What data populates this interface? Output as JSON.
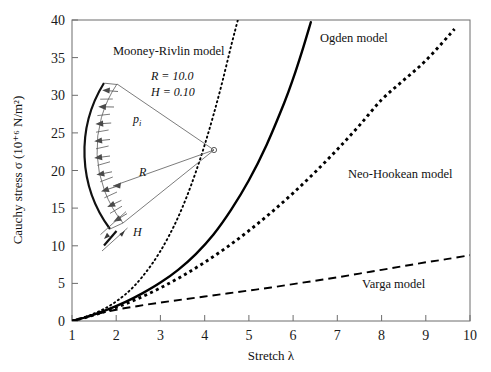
{
  "chart_data": {
    "type": "line",
    "title": "",
    "xlabel": "Stretch λ",
    "ylabel": "Cauchy stress σ (10⁺⁶ N/m²)",
    "xlim": [
      1,
      10
    ],
    "ylim": [
      0,
      40
    ],
    "xticks": [
      "1",
      "2",
      "3",
      "4",
      "5",
      "6",
      "7",
      "8",
      "9",
      "10"
    ],
    "yticks": [
      "0",
      "5",
      "10",
      "15",
      "20",
      "25",
      "30",
      "35",
      "40"
    ],
    "grid": false,
    "legend_position": "inline-annotations",
    "series": [
      {
        "name": "Mooney-Rivlin model",
        "style": "dotted",
        "color": "#000000",
        "x": [
          1.0,
          1.2,
          1.4,
          1.6,
          1.8,
          2.0,
          2.2,
          2.4,
          2.6,
          2.8,
          3.0,
          3.2,
          3.4,
          3.6,
          3.8,
          4.0,
          4.2,
          4.4,
          4.6,
          4.75
        ],
        "y": [
          0.0,
          0.35,
          0.75,
          1.25,
          1.85,
          2.6,
          3.5,
          4.6,
          5.95,
          7.5,
          9.3,
          11.4,
          13.8,
          16.6,
          19.8,
          23.4,
          27.4,
          31.8,
          36.6,
          40.0
        ]
      },
      {
        "name": "Ogden model",
        "style": "solid",
        "color": "#000000",
        "x": [
          1.0,
          1.4,
          1.8,
          2.2,
          2.6,
          3.0,
          3.4,
          3.8,
          4.2,
          4.6,
          5.0,
          5.4,
          5.8,
          6.0,
          6.2,
          6.4
        ],
        "y": [
          0.0,
          0.65,
          1.5,
          2.5,
          3.7,
          5.1,
          6.8,
          8.9,
          11.5,
          14.8,
          18.7,
          23.4,
          29.0,
          32.2,
          35.8,
          39.7
        ]
      },
      {
        "name": "Neo-Hookean model",
        "style": "dashed-dense",
        "color": "#000000",
        "x": [
          1.0,
          1.5,
          2.0,
          2.5,
          3.0,
          3.5,
          4.0,
          4.5,
          5.0,
          5.5,
          6.0,
          6.5,
          7.0,
          7.5,
          8.0,
          8.5,
          9.0,
          9.5,
          9.65
        ],
        "y": [
          0.0,
          0.8,
          1.8,
          3.0,
          4.4,
          6.0,
          7.8,
          9.8,
          12.0,
          14.4,
          17.0,
          19.8,
          22.8,
          26.0,
          29.4,
          32.0,
          34.6,
          37.8,
          38.8
        ]
      },
      {
        "name": "Varga model",
        "style": "dashed",
        "color": "#000000",
        "x": [
          1.0,
          1.5,
          2.0,
          2.5,
          3.0,
          3.5,
          4.0,
          4.5,
          5.0,
          5.5,
          6.0,
          6.5,
          7.0,
          7.5,
          8.0,
          8.5,
          9.0,
          9.5,
          10.0
        ],
        "y": [
          0.0,
          0.85,
          1.5,
          2.0,
          2.45,
          2.85,
          3.25,
          3.65,
          4.05,
          4.45,
          4.9,
          5.35,
          5.8,
          6.3,
          6.8,
          7.3,
          7.8,
          8.25,
          8.75
        ]
      }
    ],
    "annotations": [
      {
        "name": "mooney-rivlin-label",
        "text": "Mooney-Rivlin model",
        "x": 2.0,
        "y": 35.0
      },
      {
        "name": "ogden-label",
        "text": "Ogden model",
        "x": 6.7,
        "y": 36.5
      },
      {
        "name": "neo-hookean-label",
        "text": "Neo-Hookean model",
        "x": 7.6,
        "y": 18.5
      },
      {
        "name": "varga-label",
        "text": "Varga model",
        "x": 7.6,
        "y": 4.6
      }
    ],
    "inset": {
      "name": "pressurized-shell-diagram",
      "params": [
        {
          "symbol": "R",
          "equals": "=",
          "value": "10.0",
          "text": "R = 10.0"
        },
        {
          "symbol": "H",
          "equals": "=",
          "value": "0.10",
          "text": "H = 0.10"
        }
      ],
      "labels": [
        {
          "name": "internal-pressure-label",
          "text": "pᵢ"
        },
        {
          "name": "radius-label",
          "text": "R"
        },
        {
          "name": "thickness-label",
          "text": "H"
        }
      ]
    }
  }
}
